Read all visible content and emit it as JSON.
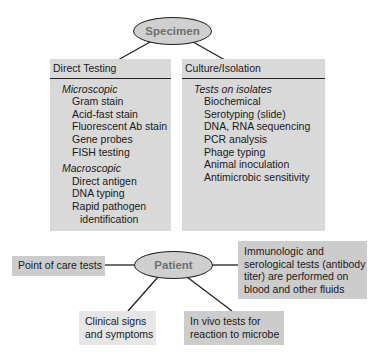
{
  "specimen": {
    "label": "Specimen"
  },
  "direct_testing": {
    "title": "Direct Testing",
    "groups": [
      {
        "label": "Microscopic",
        "items": [
          "Gram stain",
          "Acid-fast stain",
          "Fluorescent Ab stain",
          "Gene probes",
          "FISH testing"
        ]
      },
      {
        "label": "Macroscopic",
        "items": [
          "Direct antigen",
          "DNA typing",
          "Rapid pathogen",
          "identification"
        ]
      }
    ]
  },
  "culture_isolation": {
    "title": "Culture/Isolation",
    "groups": [
      {
        "label": "Tests on isolates",
        "items": [
          "Biochemical",
          "Serotyping (slide)",
          "DNA, RNA sequencing",
          "PCR analysis",
          "Phage typing",
          "Animal inoculation",
          "Antimicrobic sensitivity"
        ]
      }
    ]
  },
  "patient": {
    "label": "Patient"
  },
  "point_of_care": {
    "label": "Point of care tests"
  },
  "immunologic": {
    "lines": [
      "Immunologic and",
      "serological tests (antibody",
      "titer) are performed on",
      "blood and other fluids"
    ]
  },
  "clinical": {
    "lines": [
      "Clinical signs",
      "and symptoms"
    ]
  },
  "in_vivo": {
    "lines": [
      "In vivo tests for",
      "reaction to microbe"
    ]
  },
  "colors": {
    "panel": "#d9d9d9",
    "box_dark": "#cccccc",
    "box_light": "#e6e6e6",
    "ellipse": "#cfcfcf"
  }
}
